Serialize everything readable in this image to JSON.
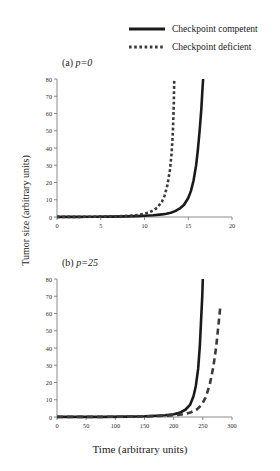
{
  "legend": {
    "position": "top-right",
    "entries": [
      {
        "label": "Checkpoint competent",
        "style": "solid",
        "icon": "solid-line-icon",
        "color": "#1a1a1a"
      },
      {
        "label": "Checkpoint deficient",
        "style": "dotted",
        "icon": "dotted-line-icon",
        "color": "#3a3a3a"
      }
    ]
  },
  "axis_titles": {
    "y": "Tumor size (arbitrary units)",
    "x": "Time (arbitrary units)"
  },
  "chart_data": [
    {
      "type": "line",
      "panel": "a",
      "title": "(a) p=0",
      "title_prefix": "(a) ",
      "title_italic": "p=0",
      "xlabel": "Time (arbitrary units)",
      "ylabel": "Tumor size (arbitrary units)",
      "xlim": [
        0,
        20
      ],
      "ylim": [
        0,
        80
      ],
      "xticks": [
        0,
        5,
        10,
        15,
        20
      ],
      "yticks": [
        0,
        10,
        20,
        30,
        40,
        50,
        60,
        70,
        80
      ],
      "grid": false,
      "legend": "shared-top",
      "series": [
        {
          "name": "Checkpoint competent",
          "style": "solid",
          "color": "#1a1a1a",
          "x": [
            0,
            2,
            4,
            6,
            8,
            9,
            10,
            11,
            12,
            12.5,
            13,
            13.5,
            14,
            14.5,
            15,
            15.3,
            15.6,
            15.9,
            16.1,
            16.3,
            16.5,
            16.6,
            16.7
          ],
          "y": [
            0.05,
            0.08,
            0.12,
            0.2,
            0.35,
            0.5,
            0.7,
            1.0,
            1.5,
            1.9,
            2.5,
            3.4,
            4.8,
            7.0,
            11.0,
            15.0,
            21.0,
            30.0,
            39.0,
            50.0,
            63.0,
            72.0,
            80.0
          ]
        },
        {
          "name": "Checkpoint deficient",
          "style": "dotted",
          "color": "#3a3a3a",
          "x": [
            0,
            2,
            4,
            6,
            7.5,
            8.5,
            9,
            9.5,
            10,
            10.5,
            11,
            11.5,
            12,
            12.3,
            12.6,
            12.9,
            13.1,
            13.25,
            13.35,
            13.4
          ],
          "y": [
            0.05,
            0.08,
            0.14,
            0.3,
            0.5,
            0.8,
            1.0,
            1.4,
            1.9,
            2.6,
            3.8,
            5.6,
            9.0,
            12.5,
            18.0,
            27.0,
            37.0,
            50.0,
            66.0,
            80.0
          ]
        }
      ]
    },
    {
      "type": "line",
      "panel": "b",
      "title": "(b) p=25",
      "title_prefix": "(b) ",
      "title_italic": "p=25",
      "xlabel": "Time (arbitrary units)",
      "ylabel": "Tumor size (arbitrary units)",
      "xlim": [
        0,
        300
      ],
      "ylim": [
        0,
        80
      ],
      "xticks": [
        0,
        50,
        100,
        150,
        200,
        250,
        300
      ],
      "yticks": [
        0,
        10,
        20,
        30,
        40,
        50,
        60,
        70,
        80
      ],
      "grid": false,
      "legend": "shared-top",
      "series": [
        {
          "name": "Checkpoint competent",
          "style": "solid",
          "color": "#1a1a1a",
          "x": [
            0,
            40,
            80,
            120,
            150,
            170,
            185,
            200,
            210,
            220,
            228,
            234,
            238,
            242,
            245,
            247,
            249,
            250
          ],
          "y": [
            0.05,
            0.07,
            0.1,
            0.2,
            0.4,
            0.7,
            1.0,
            1.6,
            2.4,
            4.2,
            7.0,
            12.0,
            18.0,
            28.0,
            42.0,
            56.0,
            70.0,
            80.0
          ]
        },
        {
          "name": "Checkpoint deficient",
          "style": "dashed",
          "color": "#3a3a3a",
          "x": [
            0,
            40,
            80,
            120,
            150,
            175,
            195,
            210,
            220,
            230,
            240,
            248,
            255,
            262,
            268,
            273,
            277,
            280
          ],
          "y": [
            0.05,
            0.07,
            0.1,
            0.18,
            0.35,
            0.6,
            0.9,
            1.3,
            1.8,
            2.8,
            4.5,
            7.0,
            11.5,
            19.0,
            29.0,
            41.0,
            54.0,
            64.0
          ]
        }
      ]
    }
  ]
}
